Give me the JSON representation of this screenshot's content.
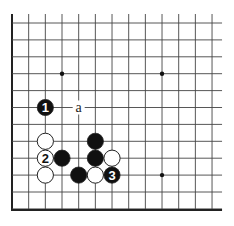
{
  "diagram": {
    "type": "go-board-fragment",
    "grid": {
      "columns": 13,
      "rows": 12,
      "origin_x": 12,
      "origin_y": 23,
      "spacing_x": 16.67,
      "spacing_y": 16.9,
      "open_top": true,
      "open_right": true,
      "edge_left": true,
      "edge_bottom": true
    },
    "colors": {
      "line": "#444444",
      "edge": "#222222",
      "black_stone": "#111111",
      "white_stone": "#ffffff",
      "stone_outline": "#222222"
    },
    "star_points": [
      {
        "col": 3,
        "row": 3
      },
      {
        "col": 9,
        "row": 3
      },
      {
        "col": 9,
        "row": 9
      }
    ],
    "stones": [
      {
        "color": "black",
        "col": 2,
        "row": 5,
        "label": "1"
      },
      {
        "color": "white",
        "col": 2,
        "row": 7,
        "label": ""
      },
      {
        "color": "white",
        "col": 2,
        "row": 8,
        "label": "2"
      },
      {
        "color": "white",
        "col": 2,
        "row": 9,
        "label": ""
      },
      {
        "color": "black",
        "col": 3,
        "row": 8,
        "label": ""
      },
      {
        "color": "black",
        "col": 5,
        "row": 7,
        "label": ""
      },
      {
        "color": "black",
        "col": 5,
        "row": 8,
        "label": ""
      },
      {
        "color": "white",
        "col": 6,
        "row": 8,
        "label": ""
      },
      {
        "color": "black",
        "col": 4,
        "row": 9,
        "label": ""
      },
      {
        "color": "white",
        "col": 5,
        "row": 9,
        "label": ""
      },
      {
        "color": "black",
        "col": 6,
        "row": 9,
        "label": "3"
      }
    ],
    "markers": [
      {
        "col": 4,
        "row": 5,
        "text": "a"
      }
    ]
  }
}
